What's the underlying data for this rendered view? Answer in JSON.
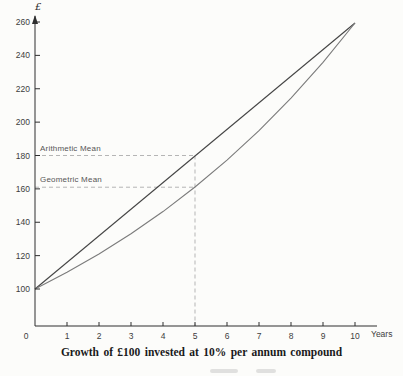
{
  "page": {
    "background": "#fcfcfa"
  },
  "chart_data": {
    "type": "line",
    "caption": "Growth of £100 invested at 10% per annum compound",
    "ylabel": "£",
    "xlabel": "Years",
    "x_ticks": [
      0,
      1,
      2,
      3,
      4,
      5,
      6,
      7,
      8,
      9,
      10
    ],
    "y_ticks": [
      100,
      120,
      140,
      160,
      180,
      200,
      220,
      240,
      260
    ],
    "xlim": [
      0,
      10.7
    ],
    "ylim": [
      77,
      263
    ],
    "grid": false,
    "legend": "inline-labels",
    "series": [
      {
        "name": "Arithmetic Mean",
        "color": "#454545",
        "x": [
          0,
          10
        ],
        "values": [
          100,
          259.4
        ]
      },
      {
        "name": "Geometric Mean",
        "color": "#7b7b7b",
        "x": [
          0,
          1,
          2,
          3,
          4,
          5,
          6,
          7,
          8,
          9,
          10
        ],
        "values": [
          100,
          110,
          121,
          133.1,
          146.4,
          161.1,
          177.2,
          194.9,
          214.4,
          235.8,
          259.4
        ]
      }
    ],
    "annotations": {
      "guide_year": 5,
      "guide_values": [
        180,
        161
      ]
    },
    "colors": {
      "axis": "#2e2e2e",
      "tick_label": "#3d3d3d",
      "dash": "#b5b5b5",
      "caption": "#1a1a1a",
      "series_label": "#565656"
    }
  }
}
